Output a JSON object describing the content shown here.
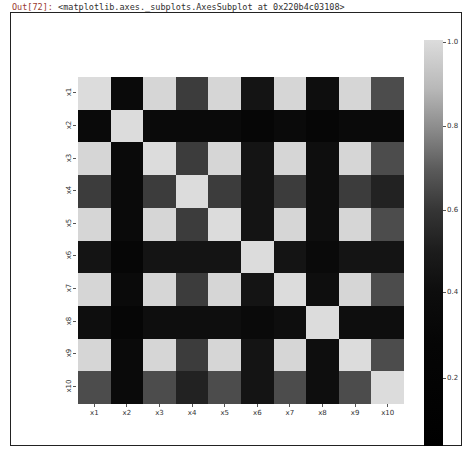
{
  "output": {
    "prompt_label": "Out[72]:",
    "repr": "<matplotlib.axes._subplots.AxesSubplot at 0x220b4c03108>"
  },
  "chart_data": {
    "type": "heatmap",
    "title": "",
    "xlabel": "",
    "ylabel": "",
    "x_labels": [
      "x1",
      "x2",
      "x3",
      "x4",
      "x5",
      "x6",
      "x7",
      "x8",
      "x9",
      "x10"
    ],
    "y_labels": [
      "x1",
      "x2",
      "x3",
      "x4",
      "x5",
      "x6",
      "x7",
      "x8",
      "x9",
      "x10"
    ],
    "values": [
      [
        1.0,
        0.3,
        0.95,
        0.6,
        0.95,
        0.4,
        0.95,
        0.35,
        0.95,
        0.65
      ],
      [
        0.3,
        1.0,
        0.3,
        0.3,
        0.3,
        0.25,
        0.3,
        0.25,
        0.3,
        0.3
      ],
      [
        0.95,
        0.3,
        1.0,
        0.6,
        0.95,
        0.4,
        0.95,
        0.35,
        0.95,
        0.65
      ],
      [
        0.6,
        0.3,
        0.6,
        1.0,
        0.6,
        0.4,
        0.6,
        0.35,
        0.6,
        0.5
      ],
      [
        0.95,
        0.3,
        0.95,
        0.6,
        1.0,
        0.4,
        0.95,
        0.35,
        0.95,
        0.65
      ],
      [
        0.4,
        0.25,
        0.4,
        0.4,
        0.4,
        1.0,
        0.4,
        0.3,
        0.4,
        0.4
      ],
      [
        0.95,
        0.3,
        0.95,
        0.6,
        0.95,
        0.4,
        1.0,
        0.35,
        0.95,
        0.65
      ],
      [
        0.35,
        0.25,
        0.35,
        0.35,
        0.35,
        0.3,
        0.35,
        1.0,
        0.35,
        0.35
      ],
      [
        0.95,
        0.3,
        0.95,
        0.6,
        0.95,
        0.4,
        0.95,
        0.35,
        1.0,
        0.65
      ],
      [
        0.65,
        0.3,
        0.65,
        0.5,
        0.65,
        0.4,
        0.65,
        0.35,
        0.65,
        1.0
      ]
    ],
    "colorbar": {
      "ticks": [
        "1.0",
        "0.8",
        "0.6",
        "0.4",
        "0.2"
      ],
      "range": [
        0.08,
        1.0
      ],
      "colormap": "grayscale (black low, light gray high)"
    },
    "grid": false,
    "legend_position": "right (colorbar)"
  }
}
